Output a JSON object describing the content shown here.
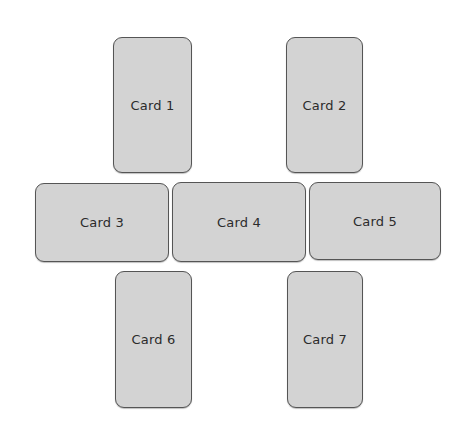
{
  "diagram": {
    "colors": {
      "background": "#ffffff",
      "card_fill": "#d3d3d3",
      "card_border": "#555555",
      "label_text": "#2b2b2b"
    },
    "cards": [
      {
        "label": "Card 1",
        "x": 113,
        "y": 37,
        "w": 79,
        "h": 136
      },
      {
        "label": "Card 2",
        "x": 286,
        "y": 37,
        "w": 77,
        "h": 136
      },
      {
        "label": "Card 3",
        "x": 35,
        "y": 183,
        "w": 134,
        "h": 79
      },
      {
        "label": "Card 4",
        "x": 172,
        "y": 182,
        "w": 134,
        "h": 80
      },
      {
        "label": "Card 5",
        "x": 309,
        "y": 182,
        "w": 132,
        "h": 78
      },
      {
        "label": "Card 6",
        "x": 115,
        "y": 271,
        "w": 77,
        "h": 137
      },
      {
        "label": "Card 7",
        "x": 287,
        "y": 271,
        "w": 76,
        "h": 137
      }
    ]
  }
}
